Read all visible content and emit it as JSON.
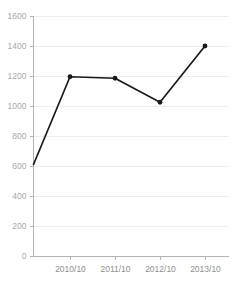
{
  "chart_data": {
    "type": "line",
    "title": "",
    "xlabel": "",
    "ylabel": "",
    "categories": [
      "",
      "2010/10",
      "2011/10",
      "2012/10",
      "2013/10"
    ],
    "tick_labels_x": [
      "2010/10",
      "2011/10",
      "2012/10",
      "2013/10"
    ],
    "values": [
      610,
      1195,
      1185,
      1025,
      1400
    ],
    "series": [
      {
        "name": "",
        "values": [
          610,
          1195,
          1185,
          1025,
          1400
        ]
      }
    ],
    "ylim": [
      0,
      1600
    ],
    "yticks": [
      0,
      200,
      400,
      600,
      800,
      1000,
      1200,
      1400,
      1600
    ],
    "ytick_labels": [
      "0",
      "200",
      "400",
      "600",
      "800",
      "1000",
      "1200",
      "1400",
      "1600"
    ],
    "grid": true,
    "grid_axis": "y",
    "legend": false,
    "legend_position": "none",
    "marker": "circle",
    "line_color": "#1a1a1a",
    "grid_color": "#ededed",
    "axis_color": "#b4b4b4",
    "tick_label_color": "#a8a8a8"
  },
  "axes": {
    "y_axis_name": "y-axis",
    "x_axis_name": "x-axis"
  }
}
